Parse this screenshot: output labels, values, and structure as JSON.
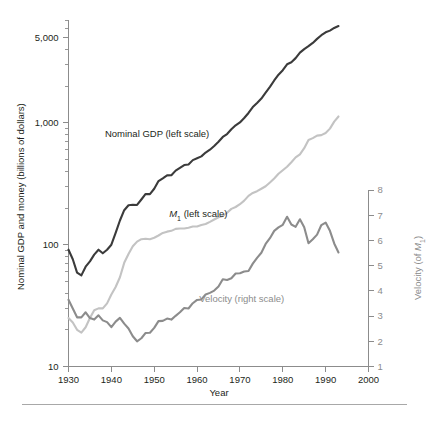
{
  "figure": {
    "background_color": "#ffffff",
    "rule_color": "#a8a8a8"
  },
  "chart_data": {
    "type": "line",
    "title": "",
    "xlabel": "Year",
    "ylabel": "Nominal GDP and money (billions of dollars)",
    "y2label": "Velocity (of M₁)",
    "xlim": [
      1930,
      2000
    ],
    "xticks": [
      1930,
      1940,
      1950,
      1960,
      1970,
      1980,
      1990,
      2000
    ],
    "xtick_labels": [
      "1930",
      "1940",
      "1950",
      "1960",
      "1970",
      "1980",
      "1990",
      "2000"
    ],
    "yscale": "log",
    "ylim": [
      10,
      7000
    ],
    "yticks": [
      10,
      100,
      1000,
      5000
    ],
    "ytick_labels": [
      "10",
      "100",
      "1,000",
      "5,000"
    ],
    "y2lim": [
      1,
      8
    ],
    "y2ticks": [
      1,
      2,
      3,
      4,
      5,
      6,
      7,
      8
    ],
    "y2tick_labels": [
      "1",
      "2",
      "3",
      "4",
      "5",
      "6",
      "7",
      "8"
    ],
    "grid": false,
    "legend": "inline-annotations",
    "series": [
      {
        "name": "Nominal GDP (left scale)",
        "axis": "left",
        "color": "#3b3b3b",
        "linewidth": 2.1,
        "label_position": {
          "x": 1938.5,
          "y": 760
        },
        "x": [
          1930,
          1931,
          1932,
          1933,
          1934,
          1935,
          1936,
          1937,
          1938,
          1939,
          1940,
          1941,
          1942,
          1943,
          1944,
          1945,
          1946,
          1947,
          1948,
          1949,
          1950,
          1951,
          1952,
          1953,
          1954,
          1955,
          1956,
          1957,
          1958,
          1959,
          1960,
          1961,
          1962,
          1963,
          1964,
          1965,
          1966,
          1967,
          1968,
          1969,
          1970,
          1971,
          1972,
          1973,
          1974,
          1975,
          1976,
          1977,
          1978,
          1979,
          1980,
          1981,
          1982,
          1983,
          1984,
          1985,
          1986,
          1987,
          1988,
          1989,
          1990,
          1991,
          1992,
          1993
        ],
        "y": [
          91,
          76,
          59,
          56,
          66,
          73,
          83,
          91,
          85,
          91,
          100,
          125,
          158,
          192,
          211,
          213,
          212,
          235,
          261,
          260,
          288,
          333,
          351,
          371,
          372,
          406,
          428,
          451,
          456,
          495,
          513,
          531,
          571,
          603,
          646,
          700,
          767,
          810,
          887,
          956,
          1010,
          1097,
          1207,
          1350,
          1459,
          1586,
          1770,
          1974,
          2232,
          2489,
          2708,
          3031,
          3150,
          3405,
          3777,
          4039,
          4269,
          4540,
          4900,
          5250,
          5546,
          5725,
          6025,
          6240
        ]
      },
      {
        "name": "M₁ (left scale)",
        "axis": "left",
        "color": "#c3c3c3",
        "linewidth": 2.1,
        "label_position": {
          "x": 1953.5,
          "y": 168
        },
        "x": [
          1930,
          1931,
          1932,
          1933,
          1934,
          1935,
          1936,
          1937,
          1938,
          1939,
          1940,
          1941,
          1942,
          1943,
          1944,
          1945,
          1946,
          1947,
          1948,
          1949,
          1950,
          1951,
          1952,
          1953,
          1954,
          1955,
          1956,
          1957,
          1958,
          1959,
          1960,
          1961,
          1962,
          1963,
          1964,
          1965,
          1966,
          1967,
          1968,
          1969,
          1970,
          1971,
          1972,
          1973,
          1974,
          1975,
          1976,
          1977,
          1978,
          1979,
          1980,
          1981,
          1982,
          1983,
          1984,
          1985,
          1986,
          1987,
          1988,
          1989,
          1990,
          1991,
          1992,
          1993
        ],
        "y": [
          25,
          23,
          20,
          19,
          21,
          25,
          29,
          30,
          30,
          33,
          39,
          45,
          54,
          71,
          84,
          97,
          106,
          111,
          112,
          111,
          114,
          119,
          125,
          128,
          130,
          135,
          136,
          136,
          138,
          141,
          141,
          145,
          148,
          154,
          161,
          168,
          172,
          183,
          197,
          204,
          215,
          230,
          252,
          266,
          275,
          288,
          302,
          324,
          350,
          382,
          409,
          437,
          475,
          521,
          552,
          620,
          725,
          750,
          787,
          794,
          826,
          898,
          1025,
          1130
        ]
      },
      {
        "name": "Velocity (right scale)",
        "axis": "right",
        "color": "#8c8c8c",
        "linewidth": 2.1,
        "label_position": {
          "x": 1960.5,
          "y": 3.55
        },
        "x": [
          1930,
          1931,
          1932,
          1933,
          1934,
          1935,
          1936,
          1937,
          1938,
          1939,
          1940,
          1941,
          1942,
          1943,
          1944,
          1945,
          1946,
          1947,
          1948,
          1949,
          1950,
          1951,
          1952,
          1953,
          1954,
          1955,
          1956,
          1957,
          1958,
          1959,
          1960,
          1961,
          1962,
          1963,
          1964,
          1965,
          1966,
          1967,
          1968,
          1969,
          1970,
          1971,
          1972,
          1973,
          1974,
          1975,
          1976,
          1977,
          1978,
          1979,
          1980,
          1981,
          1982,
          1983,
          1984,
          1985,
          1986,
          1987,
          1988,
          1989,
          1990,
          1991,
          1992,
          1993
        ],
        "y": [
          3.65,
          3.3,
          2.95,
          2.95,
          3.15,
          2.92,
          2.86,
          3.03,
          2.83,
          2.76,
          2.56,
          2.78,
          2.93,
          2.7,
          2.51,
          2.2,
          2.0,
          2.12,
          2.33,
          2.34,
          2.53,
          2.8,
          2.81,
          2.9,
          2.86,
          3.01,
          3.15,
          3.32,
          3.3,
          3.51,
          3.64,
          3.66,
          3.86,
          3.92,
          4.01,
          4.17,
          4.46,
          4.43,
          4.5,
          4.69,
          4.7,
          4.77,
          4.79,
          5.08,
          5.31,
          5.51,
          5.86,
          6.09,
          6.38,
          6.52,
          6.62,
          6.94,
          6.63,
          6.54,
          6.84,
          6.52,
          5.89,
          6.05,
          6.23,
          6.61,
          6.71,
          6.38,
          5.88,
          5.52
        ]
      }
    ]
  }
}
